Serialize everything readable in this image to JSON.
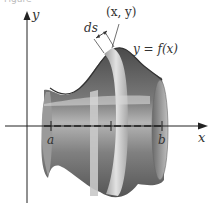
{
  "caption_fragment": "Figure",
  "axes": {
    "y_label": "y",
    "x_label": "x"
  },
  "labels": {
    "point": "(x, y)",
    "arc_length": "ds",
    "curve": "y = f(x)",
    "a": "a",
    "b": "b"
  },
  "colors": {
    "surface_dark": "#5a5a5a",
    "surface_mid": "#8a8a8a",
    "surface_light": "#c8c8c8",
    "axis": "#222222",
    "band": "#d6d6d6"
  }
}
